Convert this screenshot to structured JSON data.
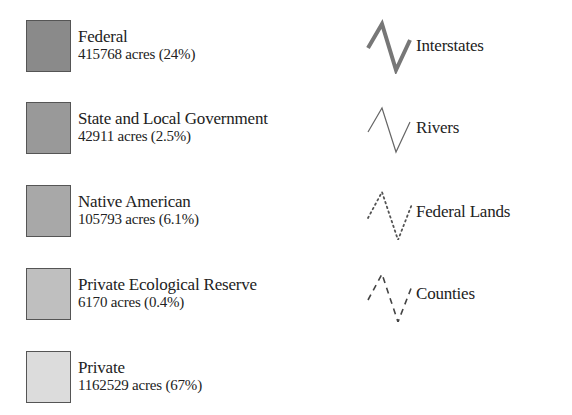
{
  "land_ownership": [
    {
      "name": "Federal",
      "stat": "415768 acres (24%)",
      "color": "#8a8a8a"
    },
    {
      "name": "State and Local Government",
      "stat": "42911 acres (2.5%)",
      "color": "#999999"
    },
    {
      "name": "Native American",
      "stat": "105793 acres (6.1%)",
      "color": "#a8a8a8"
    },
    {
      "name": "Private Ecological Reserve",
      "stat": "6170 acres (0.4%)",
      "color": "#bfbfbf"
    },
    {
      "name": "Private",
      "stat": "1162529 acres (67%)",
      "color": "#dcdcdc"
    }
  ],
  "line_types": [
    {
      "name": "Interstates",
      "icon": "thick-solid-line-icon"
    },
    {
      "name": "Rivers",
      "icon": "thin-solid-line-icon"
    },
    {
      "name": "Federal Lands",
      "icon": "dotted-line-icon"
    },
    {
      "name": "Counties",
      "icon": "dashed-line-icon"
    }
  ]
}
